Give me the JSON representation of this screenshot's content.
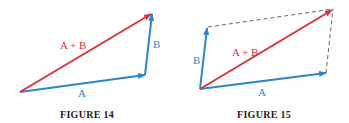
{
  "colors": {
    "vector_blue": "#2a86c8",
    "vector_red": "#d6333a",
    "dashed_gray": "#666666",
    "caption": "#222222"
  },
  "figures": [
    {
      "caption": "FIGURE 14",
      "labels": {
        "a": "A",
        "b": "B",
        "sum": "A + B"
      }
    },
    {
      "caption": "FIGURE 15",
      "labels": {
        "a": "A",
        "b": "B",
        "sum": "A + B"
      }
    }
  ]
}
